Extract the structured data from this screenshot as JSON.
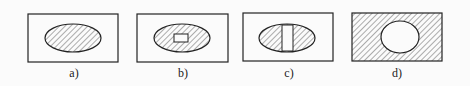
{
  "figures": [
    {
      "label": "a)",
      "description": "hatched ellipse inside rectangle"
    },
    {
      "label": "b)",
      "description": "hatched ellipse with small horizontal hole"
    },
    {
      "label": "c)",
      "description": "hatched ellipse with vertical rectangular hole"
    },
    {
      "label": "d)",
      "description": "hatched rectangle with circular hole"
    }
  ],
  "colors": {
    "stroke": "#222222",
    "background": "#fbfbfb"
  }
}
